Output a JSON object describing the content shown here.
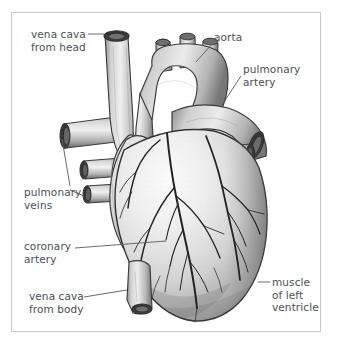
{
  "figure": {
    "style": "pencil and ink grayscale anatomical illustration",
    "view": "anterior",
    "frame_color": "#c9c9c9",
    "background_color": "#ffffff",
    "label_color": "#4b4f57"
  },
  "labels": {
    "vena_cava_head": "vena cava\nfrom head",
    "aorta": "aorta",
    "pulmonary_artery": "pulmonary\nartery",
    "pulmonary_veins": "pulmonary\nveins",
    "coronary_artery": "coronary\nartery",
    "vena_cava_body": "vena cava\nfrom body",
    "muscle_left_ventricle": "muscle\nof left\nventricle"
  },
  "structures": [
    {
      "name": "superior-vena-cava",
      "label_key": "vena_cava_head",
      "side": "upper-left"
    },
    {
      "name": "aorta",
      "label_key": "aorta",
      "side": "upper-center"
    },
    {
      "name": "pulmonary-artery",
      "label_key": "pulmonary_artery",
      "side": "upper-right"
    },
    {
      "name": "pulmonary-veins",
      "label_key": "pulmonary_veins",
      "side": "left"
    },
    {
      "name": "coronary-artery",
      "label_key": "coronary_artery",
      "side": "center"
    },
    {
      "name": "inferior-vena-cava",
      "label_key": "vena_cava_body",
      "side": "lower-left"
    },
    {
      "name": "left-ventricle-muscle",
      "label_key": "muscle_left_ventricle",
      "side": "lower-right"
    }
  ]
}
